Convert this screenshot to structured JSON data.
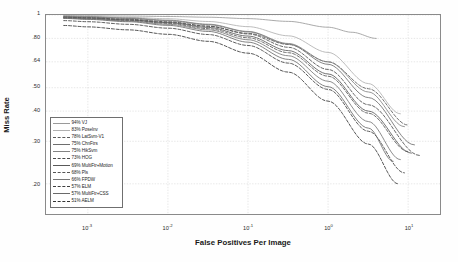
{
  "chart_data": {
    "type": "line",
    "title": "",
    "xlabel": "False Positives Per Image",
    "ylabel": "Miss Rate",
    "xscale": "log",
    "yscale": "log",
    "xlim": [
      0.0003,
      25
    ],
    "ylim": [
      0.15,
      1.0
    ],
    "grid": true,
    "legend_position": "lower-left-inside",
    "xticks": [
      {
        "value": 0.001,
        "label": "10",
        "exponent": "-3"
      },
      {
        "value": 0.01,
        "label": "10",
        "exponent": "-2"
      },
      {
        "value": 0.1,
        "label": "10",
        "exponent": "-1"
      },
      {
        "value": 1,
        "label": "10",
        "exponent": "0"
      },
      {
        "value": 10,
        "label": "10",
        "exponent": "1"
      }
    ],
    "yticks": [
      {
        "value": 1.0,
        "label": "1"
      },
      {
        "value": 0.8,
        "label": ".80"
      },
      {
        "value": 0.64,
        "label": ".64"
      },
      {
        "value": 0.5,
        "label": ".50"
      },
      {
        "value": 0.4,
        "label": ".40"
      },
      {
        "value": 0.3,
        "label": ".30"
      },
      {
        "value": 0.2,
        "label": ".20"
      }
    ],
    "series": [
      {
        "name": "VJ",
        "legend_label": "94% VJ",
        "score": 94,
        "style": "solid",
        "color": "#9a9a9a",
        "x": [
          0.0005,
          0.001,
          0.0032,
          0.01,
          0.032,
          0.1,
          0.32,
          1.0,
          2.0,
          4.0
        ],
        "y": [
          0.995,
          0.993,
          0.99,
          0.986,
          0.979,
          0.966,
          0.941,
          0.89,
          0.848,
          0.8
        ]
      },
      {
        "name": "Poselnv",
        "legend_label": "83% Poselnv",
        "score": 83,
        "style": "solid",
        "color": "#b0b0b0",
        "x": [
          0.0005,
          0.001,
          0.0032,
          0.01,
          0.032,
          0.1,
          0.32,
          1.0,
          3.2,
          8.0
        ],
        "y": [
          0.99,
          0.986,
          0.978,
          0.965,
          0.94,
          0.895,
          0.82,
          0.7,
          0.52,
          0.39
        ]
      },
      {
        "name": "LatSvm-V1",
        "legend_label": "78% LatSvm-V1",
        "score": 78,
        "style": "dashed",
        "color": "#5a5a5a",
        "x": [
          0.0005,
          0.001,
          0.0032,
          0.01,
          0.032,
          0.1,
          0.32,
          1.0,
          3.2,
          10.0
        ],
        "y": [
          0.972,
          0.966,
          0.952,
          0.932,
          0.897,
          0.84,
          0.755,
          0.64,
          0.495,
          0.35
        ]
      },
      {
        "name": "ChnFtrs",
        "legend_label": "75% ChnFtrs",
        "score": 75,
        "style": "solid",
        "color": "#6e6e6e",
        "x": [
          0.0005,
          0.001,
          0.0032,
          0.01,
          0.032,
          0.1,
          0.32,
          1.0,
          3.2,
          12.0
        ],
        "y": [
          0.985,
          0.98,
          0.968,
          0.948,
          0.912,
          0.852,
          0.758,
          0.625,
          0.455,
          0.29
        ]
      },
      {
        "name": "HikSvm",
        "legend_label": "75% HikSvm",
        "score": 75,
        "style": "solid",
        "color": "#838383",
        "x": [
          0.0005,
          0.001,
          0.0032,
          0.01,
          0.032,
          0.1,
          0.32,
          1.0,
          3.2,
          9.0
        ],
        "y": [
          0.988,
          0.983,
          0.972,
          0.952,
          0.916,
          0.855,
          0.762,
          0.64,
          0.48,
          0.345
        ]
      },
      {
        "name": "HOG",
        "legend_label": "73% HOG",
        "score": 73,
        "style": "dashed",
        "color": "#4b4b4b",
        "x": [
          0.0005,
          0.001,
          0.0032,
          0.01,
          0.032,
          0.1,
          0.32,
          1.0,
          3.2,
          14.0
        ],
        "y": [
          0.98,
          0.974,
          0.96,
          0.938,
          0.9,
          0.835,
          0.735,
          0.595,
          0.425,
          0.262
        ]
      },
      {
        "name": "MultiFtr+Motion",
        "legend_label": "69% MultiFtr+Motion",
        "score": 69,
        "style": "solid",
        "color": "#595959",
        "x": [
          0.0005,
          0.001,
          0.0032,
          0.01,
          0.032,
          0.1,
          0.32,
          1.0,
          3.2,
          11.0
        ],
        "y": [
          0.978,
          0.971,
          0.955,
          0.93,
          0.888,
          0.818,
          0.712,
          0.57,
          0.4,
          0.268
        ]
      },
      {
        "name": "Pls",
        "legend_label": "68% Pls",
        "score": 68,
        "style": "dashed",
        "color": "#555555",
        "x": [
          0.0005,
          0.001,
          0.0032,
          0.01,
          0.032,
          0.1,
          0.32,
          1.0,
          3.2,
          10.0
        ],
        "y": [
          0.975,
          0.968,
          0.95,
          0.923,
          0.878,
          0.805,
          0.698,
          0.558,
          0.392,
          0.272
        ]
      },
      {
        "name": "FPDW",
        "legend_label": "66% FPDW",
        "score": 66,
        "style": "solid",
        "color": "#777777",
        "x": [
          0.0005,
          0.001,
          0.0032,
          0.01,
          0.032,
          0.1,
          0.32,
          1.0,
          3.2,
          8.0
        ],
        "y": [
          0.972,
          0.964,
          0.944,
          0.915,
          0.868,
          0.79,
          0.678,
          0.532,
          0.362,
          0.252
        ]
      },
      {
        "name": "ELM",
        "legend_label": "57% ELM",
        "score": 57,
        "style": "dashed",
        "color": "#3f3f3f",
        "x": [
          0.0005,
          0.001,
          0.0032,
          0.01,
          0.032,
          0.1,
          0.32,
          1.0,
          3.2,
          9.0
        ],
        "y": [
          0.948,
          0.938,
          0.915,
          0.882,
          0.83,
          0.748,
          0.632,
          0.492,
          0.33,
          0.222
        ]
      },
      {
        "name": "MultiFtr+CSS",
        "legend_label": "57% MultiFtr+CSS",
        "score": 57,
        "style": "solid",
        "color": "#6a6a6a",
        "x": [
          0.0005,
          0.001,
          0.0032,
          0.01,
          0.032,
          0.1,
          0.32,
          1.0,
          3.2,
          6.5
        ],
        "y": [
          0.968,
          0.959,
          0.938,
          0.906,
          0.855,
          0.772,
          0.655,
          0.505,
          0.34,
          0.248
        ]
      },
      {
        "name": "AELM",
        "legend_label": "51% AELM",
        "score": 51,
        "style": "dashed",
        "color": "#353535",
        "x": [
          0.0005,
          0.001,
          0.0032,
          0.01,
          0.032,
          0.1,
          0.32,
          1.0,
          3.2,
          7.5
        ],
        "y": [
          0.905,
          0.893,
          0.868,
          0.832,
          0.778,
          0.695,
          0.58,
          0.44,
          0.292,
          0.2
        ]
      }
    ]
  }
}
